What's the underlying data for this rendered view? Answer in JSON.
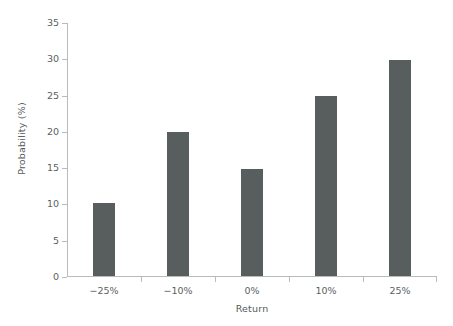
{
  "chart_data": {
    "type": "bar",
    "title": "",
    "xlabel": "Return",
    "ylabel": "Probability (%)",
    "categories": [
      "−25%",
      "−10%",
      "0%",
      "10%",
      "25%"
    ],
    "values": [
      10.0,
      19.9,
      14.8,
      24.8,
      29.7
    ],
    "ylim": [
      0,
      35
    ],
    "ytick_labels": [
      "0",
      "5",
      "10",
      "15",
      "20",
      "25",
      "30",
      "35"
    ],
    "ytick_values": [
      0,
      5,
      10,
      15,
      20,
      25,
      30,
      35
    ],
    "grid": false,
    "legend": false,
    "bar_color": "#585d5d",
    "axis_color": "#b9bcbc",
    "text_color": "#5a5f5f",
    "background": "#ffffff"
  }
}
